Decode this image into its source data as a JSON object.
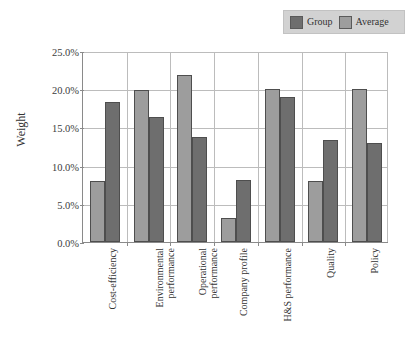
{
  "chart_data": {
    "type": "bar",
    "title": "",
    "subtitle": "",
    "xlabel": "",
    "ylabel": "Weight",
    "ylim": [
      0,
      25
    ],
    "grid": true,
    "legend_position": "top-right",
    "value_suffix": "%",
    "categories": [
      "Cost-efficiency",
      "Environmental performance",
      "Operational performance",
      "Company profile",
      "H&S performance",
      "Quality",
      "Policy"
    ],
    "category_lines": [
      [
        "Cost-efficiency"
      ],
      [
        "Environmental",
        "performance"
      ],
      [
        "Operational",
        "performance"
      ],
      [
        "Company profile"
      ],
      [
        "H&S performance"
      ],
      [
        "Quality"
      ],
      [
        "Policy"
      ]
    ],
    "series": [
      {
        "name": "Average",
        "color": "#9d9d9d",
        "values": [
          8.0,
          19.9,
          21.9,
          3.2,
          20.0,
          8.0,
          20.0
        ]
      },
      {
        "name": "Group",
        "color": "#6e6e6e",
        "values": [
          18.3,
          16.4,
          13.8,
          8.1,
          19.0,
          13.3,
          13.0
        ]
      }
    ],
    "bar_order": [
      "Average",
      "Group"
    ],
    "yticks": [
      {
        "value": 25,
        "label": "25.0%"
      },
      {
        "value": 20,
        "label": "20.0%"
      },
      {
        "value": 15,
        "label": "15.0%"
      },
      {
        "value": 10,
        "label": "10.0%"
      },
      {
        "value": 5,
        "label": "5.0%"
      },
      {
        "value": 0,
        "label": "0.0%"
      }
    ]
  },
  "legend": {
    "background": "#d2d2d2",
    "entries": [
      {
        "label": "Group",
        "color": "#6e6e6e"
      },
      {
        "label": "Average",
        "color": "#9d9d9d"
      }
    ]
  },
  "axis": {
    "y_title": "Weight"
  }
}
